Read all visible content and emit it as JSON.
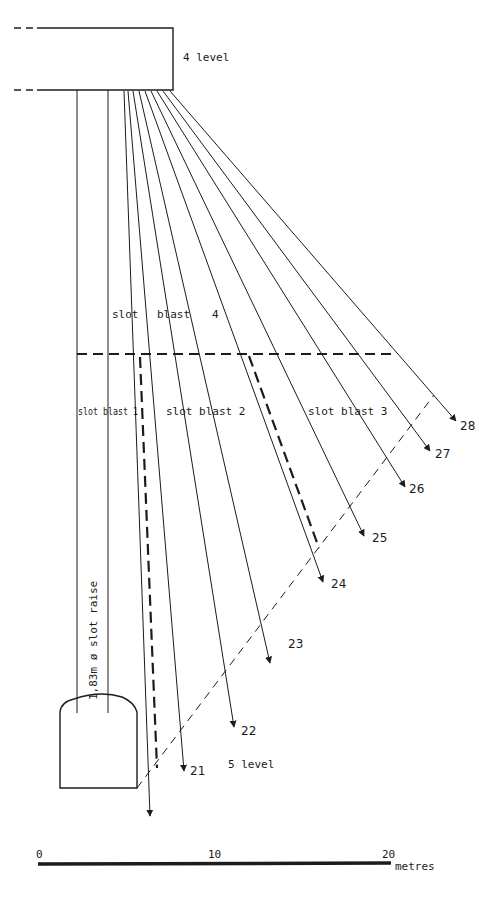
{
  "diagram": {
    "type": "mining-section",
    "levels": {
      "upper": "4 level",
      "lower": "5 level"
    },
    "raise_label": "1,83m ø slot raise",
    "slot_blasts": [
      {
        "label": "slot blast 1"
      },
      {
        "label": "slot blast 2"
      },
      {
        "label": "slot blast 3"
      },
      {
        "label_parts": [
          "slot",
          "blast",
          "4"
        ]
      }
    ],
    "blast_holes": [
      {
        "number": "21"
      },
      {
        "number": "22"
      },
      {
        "number": "23"
      },
      {
        "number": "24"
      },
      {
        "number": "25"
      },
      {
        "number": "26"
      },
      {
        "number": "27"
      },
      {
        "number": "28"
      }
    ],
    "scale_bar": {
      "ticks": [
        "0",
        "10",
        "20"
      ],
      "unit": "metres"
    }
  }
}
